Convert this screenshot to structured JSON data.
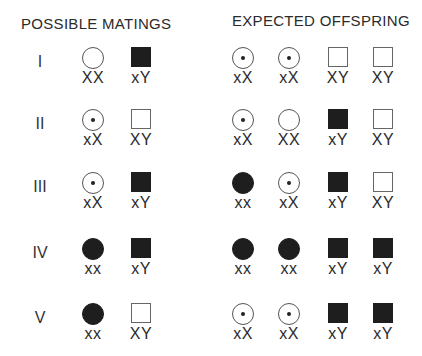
{
  "headings": {
    "left": "POSSIBLE MATINGS",
    "right": "EXPECTED OFFSPRING"
  },
  "legend_semantics": {
    "circle-open": "unaffected female",
    "circle-dot": "carrier female",
    "circle-filled": "affected female",
    "square-open": "unaffected male",
    "square-filled": "affected male"
  },
  "rows": [
    {
      "numeral": "I",
      "parents": [
        {
          "shape": "circle",
          "fill": "open",
          "genotype": "XX"
        },
        {
          "shape": "square",
          "fill": "filled",
          "genotype": "xY"
        }
      ],
      "offspring": [
        {
          "shape": "circle",
          "fill": "carrier",
          "genotype": "xX"
        },
        {
          "shape": "circle",
          "fill": "carrier",
          "genotype": "xX"
        },
        {
          "shape": "square",
          "fill": "open",
          "genotype": "XY"
        },
        {
          "shape": "square",
          "fill": "open",
          "genotype": "XY"
        }
      ]
    },
    {
      "numeral": "II",
      "parents": [
        {
          "shape": "circle",
          "fill": "carrier",
          "genotype": "xX"
        },
        {
          "shape": "square",
          "fill": "open",
          "genotype": "XY"
        }
      ],
      "offspring": [
        {
          "shape": "circle",
          "fill": "carrier",
          "genotype": "xX"
        },
        {
          "shape": "circle",
          "fill": "open",
          "genotype": "XX"
        },
        {
          "shape": "square",
          "fill": "filled",
          "genotype": "xY"
        },
        {
          "shape": "square",
          "fill": "open",
          "genotype": "XY"
        }
      ]
    },
    {
      "numeral": "III",
      "parents": [
        {
          "shape": "circle",
          "fill": "carrier",
          "genotype": "xX"
        },
        {
          "shape": "square",
          "fill": "filled",
          "genotype": "xY"
        }
      ],
      "offspring": [
        {
          "shape": "circle",
          "fill": "filled",
          "genotype": "xx"
        },
        {
          "shape": "circle",
          "fill": "carrier",
          "genotype": "xX"
        },
        {
          "shape": "square",
          "fill": "filled",
          "genotype": "xY"
        },
        {
          "shape": "square",
          "fill": "open",
          "genotype": "XY"
        }
      ]
    },
    {
      "numeral": "IV",
      "parents": [
        {
          "shape": "circle",
          "fill": "filled",
          "genotype": "xx"
        },
        {
          "shape": "square",
          "fill": "filled",
          "genotype": "xY"
        }
      ],
      "offspring": [
        {
          "shape": "circle",
          "fill": "filled",
          "genotype": "xx"
        },
        {
          "shape": "circle",
          "fill": "filled",
          "genotype": "xx"
        },
        {
          "shape": "square",
          "fill": "filled",
          "genotype": "xY"
        },
        {
          "shape": "square",
          "fill": "filled",
          "genotype": "xY"
        }
      ]
    },
    {
      "numeral": "V",
      "parents": [
        {
          "shape": "circle",
          "fill": "filled",
          "genotype": "xx"
        },
        {
          "shape": "square",
          "fill": "open",
          "genotype": "XY"
        }
      ],
      "offspring": [
        {
          "shape": "circle",
          "fill": "carrier",
          "genotype": "xX"
        },
        {
          "shape": "circle",
          "fill": "carrier",
          "genotype": "xX"
        },
        {
          "shape": "square",
          "fill": "filled",
          "genotype": "xY"
        },
        {
          "shape": "square",
          "fill": "filled",
          "genotype": "xY"
        }
      ]
    }
  ]
}
